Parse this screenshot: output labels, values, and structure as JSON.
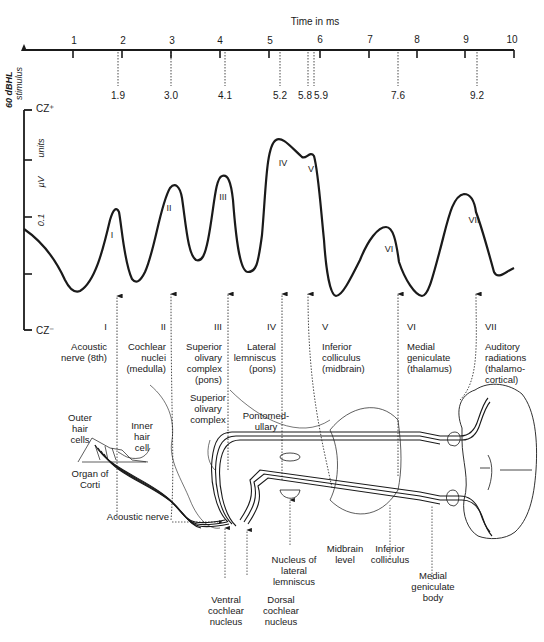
{
  "time_axis": {
    "label": "Time in ms",
    "ticks": [
      "1",
      "2",
      "3",
      "4",
      "5",
      "6",
      "7",
      "8",
      "9",
      "10"
    ],
    "latency_markers": [
      "1.9",
      "3.0",
      "4.1",
      "5.2",
      "5.8",
      "5.9",
      "7.6",
      "9.2"
    ]
  },
  "y_axis": {
    "stimulus_label": "60 dBHL",
    "stimulus_sublabel": "stimulus",
    "top_label": "CZ⁺",
    "bottom_label": "CZ⁻",
    "scale_value": "0.1",
    "scale_units": "µV",
    "scale_units_word": "units"
  },
  "waves": [
    {
      "numeral": "I",
      "latency": "1.9"
    },
    {
      "numeral": "II",
      "latency": "3.0"
    },
    {
      "numeral": "III",
      "latency": "4.1"
    },
    {
      "numeral": "IV",
      "latency": "5.2"
    },
    {
      "numeral": "V",
      "latency": "5.8"
    },
    {
      "numeral": "VI",
      "latency": "7.6"
    },
    {
      "numeral": "VII",
      "latency": "9.2"
    }
  ],
  "generators": [
    {
      "numeral": "I",
      "lines": [
        "Acoustic",
        "nerve (8th)"
      ]
    },
    {
      "numeral": "II",
      "lines": [
        "Cochlear",
        "nuclei",
        "(medulla)"
      ]
    },
    {
      "numeral": "III",
      "lines": [
        "Superior",
        "olivary",
        "complex",
        "(pons)"
      ]
    },
    {
      "numeral": "IV",
      "lines": [
        "Lateral",
        "lemniscus",
        "(pons)"
      ]
    },
    {
      "numeral": "V",
      "lines": [
        "Inferior",
        "colliculus",
        "(midbrain)"
      ]
    },
    {
      "numeral": "VI",
      "lines": [
        "Medial",
        "geniculate",
        "(thalamus)"
      ]
    },
    {
      "numeral": "VII",
      "lines": [
        "Auditory",
        "radiations",
        "(thalamo-",
        "cortical)"
      ]
    }
  ],
  "anatomy_labels": {
    "outer_hair_cells": [
      "Outer",
      "hair",
      "cells"
    ],
    "inner_hair_cell": [
      "Inner",
      "hair",
      "cell"
    ],
    "organ_of_corti": [
      "Organ of",
      "Corti"
    ],
    "acoustic_nerve": "Acoustic nerve",
    "superior_olivary_complex": [
      "Superior",
      "olivary",
      "complex"
    ],
    "pontomedullary": [
      "Pontomed-",
      "ullary"
    ],
    "ventral_cochlear_nucleus": [
      "Ventral",
      "cochlear",
      "nucleus"
    ],
    "dorsal_cochlear_nucleus": [
      "Dorsal",
      "cochlear",
      "nucleus"
    ],
    "nucleus_lateral_lemniscus": [
      "Nucleus of",
      "lateral",
      "lemniscus"
    ],
    "midbrain_level": [
      "Midbrain",
      "level"
    ],
    "inferior_colliculus": [
      "Inferior",
      "colliculus"
    ],
    "medial_geniculate_body": [
      "Medial",
      "geniculate",
      "body"
    ]
  },
  "colors": {
    "ink": "#1a1a1a",
    "background": "#ffffff"
  }
}
